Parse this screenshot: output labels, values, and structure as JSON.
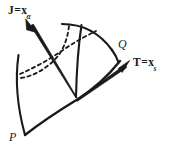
{
  "figure": {
    "kind": "line-diagram",
    "background_color": "#ffffff",
    "stroke_color": "#1a1a1a",
    "labels": {
      "vector_j": {
        "symbol": "J",
        "equals": "=",
        "base": "x",
        "subscript": "α"
      },
      "vector_t": {
        "symbol": "T",
        "equals": "=",
        "base": "x",
        "subscript": "s"
      },
      "point_q": "Q",
      "point_p": "P"
    },
    "geometry": {
      "patch_corners": {
        "P": [
          25,
          135
        ],
        "Q": [
          118,
          62
        ],
        "top_left": [
          62,
          24
        ],
        "left_upper": [
          18,
          55
        ]
      },
      "solid_curves": 5,
      "dashed_curves": 2,
      "arrows": [
        {
          "name": "J",
          "from": [
            76,
            97
          ],
          "to": [
            26,
            20
          ]
        },
        {
          "name": "T",
          "from": [
            78,
            99
          ],
          "to": [
            128,
            61
          ]
        }
      ]
    }
  }
}
